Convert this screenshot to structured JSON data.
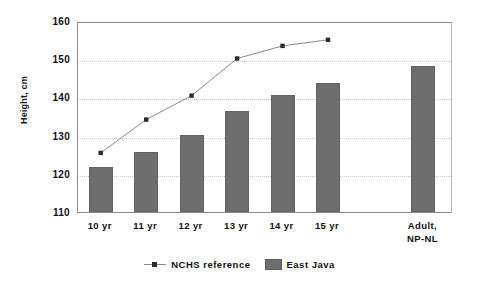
{
  "chart_data": {
    "type": "bar",
    "title": "",
    "xlabel": "",
    "ylabel": "Height, cm",
    "ylim": [
      110,
      160
    ],
    "yticks": [
      110,
      120,
      130,
      140,
      150,
      160
    ],
    "grid": true,
    "legend_position": "bottom",
    "categories": [
      "10 yr",
      "11 yr",
      "12 yr",
      "13 yr",
      "14 yr",
      "15 yr",
      "Adult,\nNP-NL"
    ],
    "series": [
      {
        "name": "NCHS reference",
        "type": "line",
        "marker": "square",
        "color": "#8a8a8a",
        "marker_color": "#2b2b2b",
        "values": [
          126.0,
          134.7,
          141.0,
          150.7,
          154.0,
          155.6,
          null
        ]
      },
      {
        "name": "East Java",
        "type": "bar",
        "color": "#6e6e6e",
        "values": [
          121.7,
          125.8,
          130.2,
          136.5,
          140.6,
          143.9,
          148.2
        ]
      }
    ]
  },
  "legend": {
    "items": [
      {
        "label": "NCHS reference",
        "marker": "line-marker-icon"
      },
      {
        "label": "East Java",
        "marker": "square-swatch-icon"
      }
    ]
  }
}
